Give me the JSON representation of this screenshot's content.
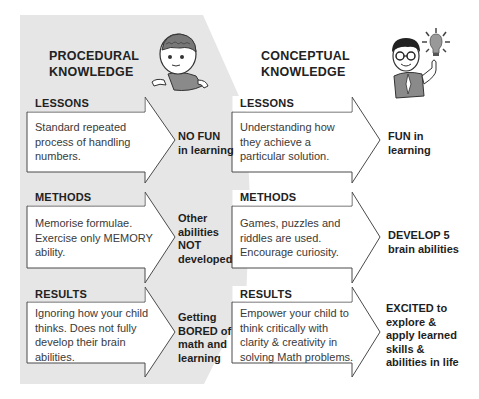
{
  "colors": {
    "left_panel_bg": "#e6e6e6",
    "right_panel_bg": "#ffffff",
    "arrow_fill": "#ffffff",
    "arrow_stroke": "#555555",
    "text": "#222222"
  },
  "left": {
    "title_line1": "PROCEDURAL",
    "title_line2": "KNOWLEDGE",
    "character": "boy-with-brain-icon",
    "rows": [
      {
        "heading": "LESSONS",
        "body": [
          "Standard repeated",
          "process of handling",
          "numbers."
        ],
        "outcome": [
          "NO FUN",
          "in learning"
        ]
      },
      {
        "heading": "METHODS",
        "body": [
          "Memorise formulae.",
          "Exercise only MEMORY",
          "ability."
        ],
        "outcome": [
          "Other",
          "abilities",
          "NOT",
          "developed"
        ]
      },
      {
        "heading": "RESULTS",
        "body": [
          "Ignoring how your child",
          "thinks. Does not fully",
          "develop their brain",
          "abilities."
        ],
        "outcome": [
          "Getting",
          "BORED of",
          "math and",
          "learning"
        ]
      }
    ]
  },
  "right": {
    "title_line1": "CONCEPTUAL",
    "title_line2": "KNOWLEDGE",
    "character": "boy-with-lightbulb-icon",
    "rows": [
      {
        "heading": "LESSONS",
        "body": [
          "Understanding how",
          "they achieve a",
          "particular solution."
        ],
        "outcome": [
          "FUN in",
          "learning"
        ]
      },
      {
        "heading": "METHODS",
        "body": [
          "Games, puzzles and",
          "riddles are used.",
          "Encourage curiosity."
        ],
        "outcome": [
          "DEVELOP 5",
          "brain abilities"
        ]
      },
      {
        "heading": "RESULTS",
        "body": [
          "Empower your child to",
          "think critically with",
          "clarity & creativity in",
          "solving Math problems."
        ],
        "outcome": [
          "EXCITED to",
          "explore &",
          "apply learned",
          "skills &",
          "abilities in life"
        ]
      }
    ]
  }
}
